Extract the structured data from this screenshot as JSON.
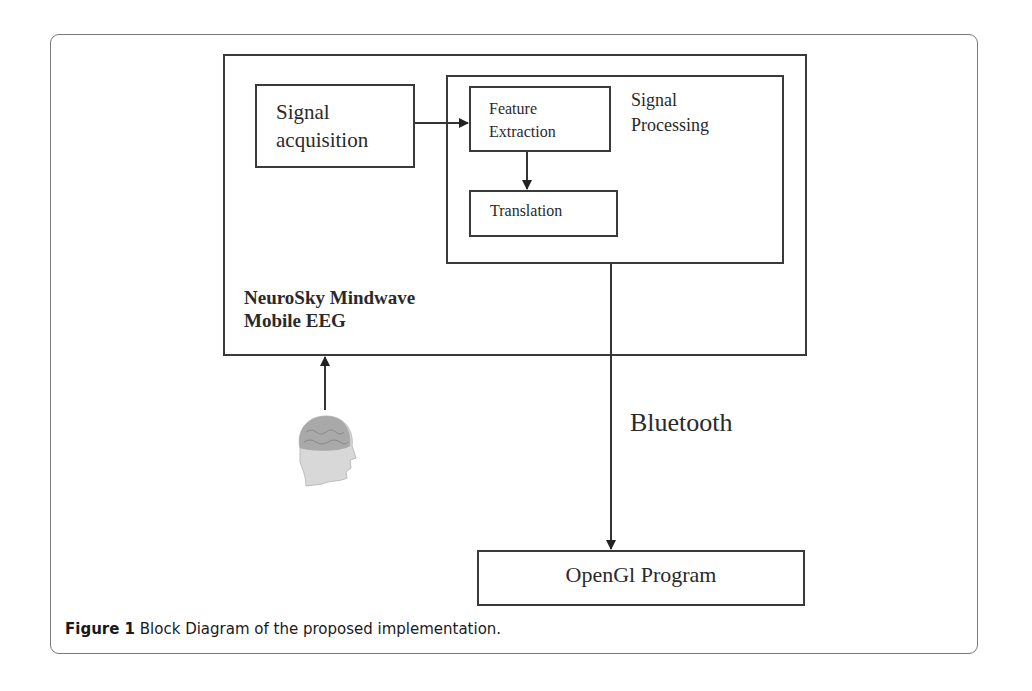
{
  "figure": {
    "caption_label": "Figure 1",
    "caption_text": " Block Diagram of the proposed implementation."
  },
  "diagram": {
    "outer_box": {
      "label_line1": "NeuroSky Mindwave",
      "label_line2": "Mobile EEG"
    },
    "signal_acquisition": {
      "line1": "Signal",
      "line2": "acquisition"
    },
    "signal_processing": {
      "line1": "Signal",
      "line2": "Processing"
    },
    "feature_extraction": {
      "line1": "Feature",
      "line2": "Extraction"
    },
    "translation": {
      "label": "Translation"
    },
    "connection_label": "Bluetooth",
    "opengl": {
      "label": "OpenGl Program"
    },
    "user_icon": "human-head-brain-icon",
    "edges": [
      {
        "from": "human-head",
        "to": "NeuroSky Mindwave Mobile EEG"
      },
      {
        "from": "Signal acquisition",
        "to": "Feature Extraction"
      },
      {
        "from": "Feature Extraction",
        "to": "Translation"
      },
      {
        "from": "Signal Processing",
        "to": "OpenGl Program",
        "label": "Bluetooth"
      }
    ]
  }
}
